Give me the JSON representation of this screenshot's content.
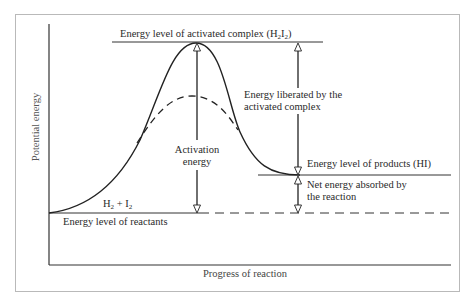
{
  "diagram": {
    "type": "energy-profile",
    "axes": {
      "ylabel": "Potential energy",
      "xlabel": "Progress of reaction"
    },
    "labels": {
      "activated_complex_prefix": "Energy level of activated complex (H",
      "activated_complex_sub1": "2",
      "activated_complex_mid": "I",
      "activated_complex_sub2": "2",
      "activated_complex_suffix": ")",
      "activation_line1": "Activation",
      "activation_line2": "energy",
      "liberated_line1": "Energy liberated by the",
      "liberated_line2": "activated complex",
      "products": "Energy level of products (HI)",
      "net_line1": "Net energy absorbed by",
      "net_line2": "the reaction",
      "reactants_formula_h": "H",
      "reactants_formula_sub1": "2",
      "reactants_formula_plus": " + I",
      "reactants_formula_sub2": "2",
      "reactants": "Energy level of reactants"
    },
    "levels": {
      "reactants": "low",
      "activated_complex": "peak",
      "catalyzed_peak": "dashed lower peak",
      "products": "intermediate"
    },
    "colors": {
      "line": "#222222",
      "frame": "#b9b9b9",
      "text": "#2a2a2a"
    }
  }
}
